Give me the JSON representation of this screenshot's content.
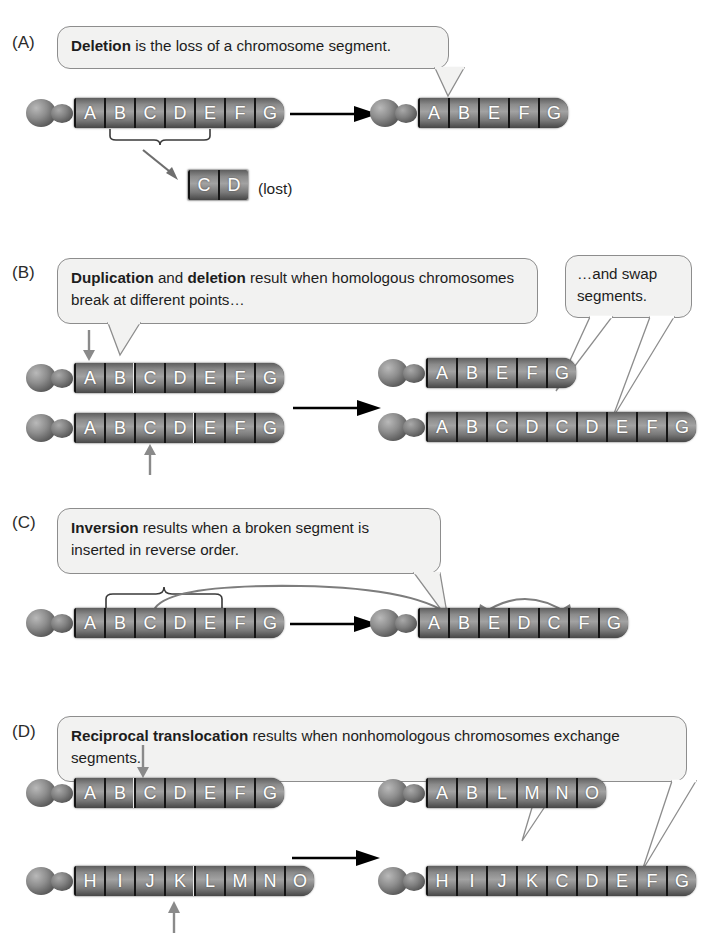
{
  "figure": {
    "colors": {
      "bubble_fill": "#f2f2f1",
      "bubble_border": "#8d8d8d",
      "band_light": "#a2a2a2",
      "band_dark": "#474747",
      "band_divider": "#141414",
      "band_label": "#ffffff",
      "break_marker": "#e8e8e8",
      "arrow_black": "#000000",
      "arrow_gray": "#8a8a8a",
      "text": "#1d1d1d"
    }
  },
  "panels": [
    {
      "letter": "(A)",
      "name": "deletion",
      "callout": {
        "bold": "Deletion",
        "rest": " is the loss of a chromosome segment."
      },
      "before": [
        {
          "bands": [
            "A",
            "B",
            "C",
            "D",
            "E",
            "F",
            "G"
          ]
        }
      ],
      "after": [
        {
          "bands": [
            "A",
            "B",
            "E",
            "F",
            "G"
          ]
        }
      ],
      "fragment": {
        "bands": [
          "C",
          "D"
        ],
        "label": "(lost)"
      },
      "brace_label": "deleted-segment-brace"
    },
    {
      "letter": "(B)",
      "name": "duplication-and-deletion",
      "callout": {
        "bold": "Duplication",
        "mid": " and ",
        "bold2": "deletion",
        "rest": " result when homologous chromosomes break at different points…"
      },
      "callout2": {
        "line1": "…and swap",
        "line2": "segments."
      },
      "before": [
        {
          "bands": [
            "A",
            "B",
            "C",
            "D",
            "E",
            "F",
            "G"
          ],
          "break_after_index": 1
        },
        {
          "bands": [
            "A",
            "B",
            "C",
            "D",
            "E",
            "F",
            "G"
          ],
          "break_after_index": 3
        }
      ],
      "after": [
        {
          "bands": [
            "A",
            "B",
            "E",
            "F",
            "G"
          ]
        },
        {
          "bands": [
            "A",
            "B",
            "C",
            "D",
            "C",
            "D",
            "E",
            "F",
            "G"
          ]
        }
      ]
    },
    {
      "letter": "(C)",
      "name": "inversion",
      "callout": {
        "bold": "Inversion",
        "rest": " results when a broken segment is inserted in reverse order."
      },
      "before": [
        {
          "bands": [
            "A",
            "B",
            "C",
            "D",
            "E",
            "F",
            "G"
          ]
        }
      ],
      "after": [
        {
          "bands": [
            "A",
            "B",
            "E",
            "D",
            "C",
            "F",
            "G"
          ]
        }
      ],
      "brace_label": "inverted-segment-brace"
    },
    {
      "letter": "(D)",
      "name": "reciprocal-translocation",
      "callout": {
        "bold": "Reciprocal translocation",
        "rest": " results when nonhomologous chromosomes exchange segments."
      },
      "before": [
        {
          "bands": [
            "A",
            "B",
            "C",
            "D",
            "E",
            "F",
            "G"
          ],
          "break_after_index": 1
        },
        {
          "bands": [
            "H",
            "I",
            "J",
            "K",
            "L",
            "M",
            "N",
            "O"
          ],
          "break_after_index": 3
        }
      ],
      "after": [
        {
          "bands": [
            "A",
            "B",
            "L",
            "M",
            "N",
            "O"
          ]
        },
        {
          "bands": [
            "H",
            "I",
            "J",
            "K",
            "C",
            "D",
            "E",
            "F",
            "G"
          ]
        }
      ]
    }
  ]
}
